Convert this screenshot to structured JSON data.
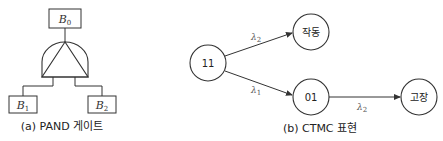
{
  "figure_a": {
    "caption": "(a) PAND 게이트",
    "top_event": {
      "base": "B",
      "sub": "0"
    },
    "inputs": [
      {
        "base": "B",
        "sub": "1"
      },
      {
        "base": "B",
        "sub": "2"
      }
    ],
    "gate_type": "PAND"
  },
  "figure_b": {
    "caption": "(b) CTMC 표현",
    "nodes": [
      {
        "id": "n11",
        "label": "11"
      },
      {
        "id": "nup",
        "label": "작동"
      },
      {
        "id": "n01",
        "label": "01"
      },
      {
        "id": "nfail",
        "label": "고장"
      }
    ],
    "edges": [
      {
        "from": "11",
        "to": "작동",
        "label_base": "λ",
        "label_sub": "2"
      },
      {
        "from": "11",
        "to": "01",
        "label_base": "λ",
        "label_sub": "1"
      },
      {
        "from": "01",
        "to": "고장",
        "label_base": "λ",
        "label_sub": "2"
      }
    ]
  },
  "colors": {
    "stroke": "#333333",
    "background": "#ffffff"
  }
}
